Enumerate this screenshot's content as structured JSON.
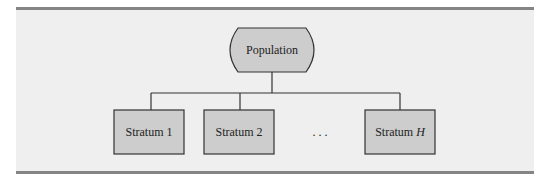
{
  "diagram": {
    "root": {
      "label": "Population"
    },
    "children": [
      {
        "label": "Stratum 1"
      },
      {
        "label": "Stratum 2"
      },
      {
        "label": "Stratum ",
        "italic_suffix": "H"
      }
    ],
    "ellipsis": ". . ."
  },
  "colors": {
    "panel_bg": "#efefef",
    "node_fill": "#cdcdcd",
    "stroke": "#333333",
    "rule": "#858585"
  }
}
